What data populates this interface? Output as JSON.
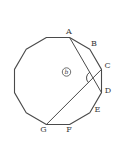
{
  "figure": {
    "canvas": {
      "width": 115,
      "height": 141,
      "background": "#ffffff"
    },
    "style": {
      "stroke_color": "#4a4a4a",
      "label_color": "#3a3a3a",
      "polygon_stroke_width": 1.1,
      "line_stroke_width": 1.0,
      "label_font_size": 8,
      "angle_label_font_size": 6
    },
    "polygon": {
      "sides": 12,
      "vertices": [
        {
          "name": "A",
          "x": 69.6,
          "y": 37.5,
          "label_x": 69,
          "label_y": 34
        },
        {
          "name": "B",
          "x": 89.8,
          "y": 49.2,
          "label_x": 94,
          "label_y": 46
        },
        {
          "name": "C",
          "x": 101.5,
          "y": 69.4,
          "label_x": 107.5,
          "label_y": 68
        },
        {
          "name": "D",
          "x": 101.5,
          "y": 92.6,
          "label_x": 108,
          "label_y": 93
        },
        {
          "name": "E",
          "x": 89.8,
          "y": 112.8,
          "label_x": 97.5,
          "label_y": 112
        },
        {
          "name": "F",
          "x": 69.6,
          "y": 124.5,
          "label_x": 69,
          "label_y": 132
        },
        {
          "name": "G",
          "x": 46.4,
          "y": 124.5,
          "label_x": 43.5,
          "label_y": 132
        },
        {
          "name": "",
          "x": 26.2,
          "y": 112.8
        },
        {
          "name": "",
          "x": 14.5,
          "y": 92.6
        },
        {
          "name": "",
          "x": 14.5,
          "y": 69.4
        },
        {
          "name": "",
          "x": 26.2,
          "y": 49.2
        },
        {
          "name": "",
          "x": 46.4,
          "y": 37.5
        }
      ]
    },
    "diagonals": [
      {
        "from": "A",
        "to": "D"
      },
      {
        "from": "G",
        "to": "C"
      }
    ],
    "angle_marker": {
      "cx": 93.0,
      "cy": 77.9,
      "r": 6.5,
      "start_deg": 135,
      "end_deg": 240
    },
    "angle_label": {
      "text": "b",
      "circled": true,
      "cx": 66.5,
      "cy": 72,
      "circle_r": 4.2
    }
  }
}
